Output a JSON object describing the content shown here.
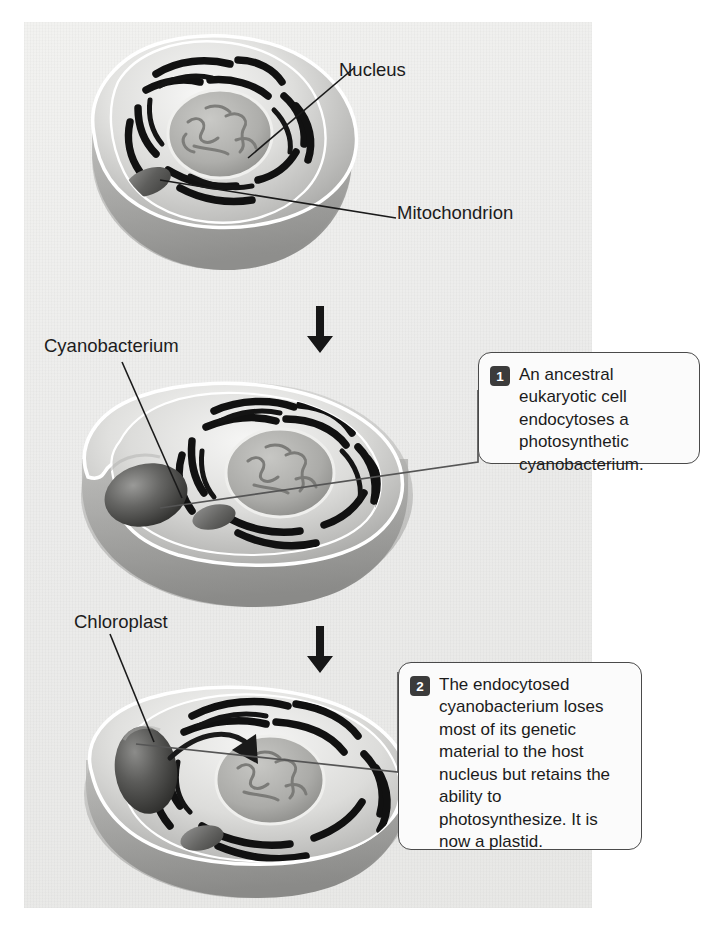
{
  "figure": {
    "letter": ")",
    "background_color": "#ffffff",
    "panel_color": "#ededeb",
    "ink_color": "#1c1c1c"
  },
  "labels": {
    "nucleus": "Nucleus",
    "mitochondrion": "Mitochondrion",
    "cyanobacterium": "Cyanobacterium",
    "chloroplast": "Chloroplast"
  },
  "callouts": [
    {
      "number": "1",
      "text": "An ancestral eukaryotic cell endocytoses a photosynthetic cyanobacterium."
    },
    {
      "number": "2",
      "text": "The endocytosed cyanobacterium loses most of its genetic material to the host nucleus but retains the ability to photosynthesize. It is now a plastid."
    }
  ],
  "stages": [
    {
      "name": "ancestral-eukaryotic-cell"
    },
    {
      "name": "cell-endocytosing-cyanobacterium"
    },
    {
      "name": "cell-with-plastid"
    }
  ],
  "arrows": {
    "between_stage_1_and_2": "down-arrow",
    "between_stage_2_and_3": "down-arrow"
  }
}
